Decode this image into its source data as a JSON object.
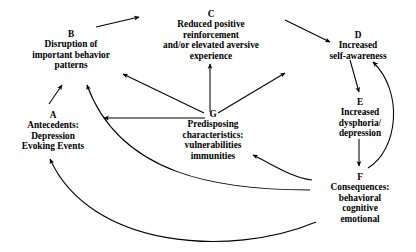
{
  "diagram": {
    "type": "flow-cycle-diagram",
    "background_color": "#ffffff",
    "line_color": "#000000",
    "nodes": [
      {
        "key": "A",
        "id_label": "A",
        "lines": [
          "Antecedents:",
          "Depression",
          "Evoking Events"
        ]
      },
      {
        "key": "B",
        "id_label": "B",
        "lines": [
          "Disruption of",
          "important behavior",
          "patterns"
        ]
      },
      {
        "key": "C",
        "id_label": "C",
        "lines": [
          "Reduced positive",
          "reinforcement",
          "and/or elevated aversive",
          "experience"
        ]
      },
      {
        "key": "D",
        "id_label": "D",
        "lines": [
          "Increased",
          "self-awareness"
        ]
      },
      {
        "key": "E",
        "id_label": "E",
        "lines": [
          "Increased",
          "dysphoria/",
          "depression"
        ]
      },
      {
        "key": "F",
        "id_label": "F",
        "lines": [
          "Consequences:",
          "behavioral",
          "cognitive",
          "emotional"
        ]
      },
      {
        "key": "G",
        "id_label": "G",
        "lines": [
          "Predisposing",
          "characteristics:",
          "vulnerabilities",
          "immunities"
        ]
      }
    ],
    "edges": [
      {
        "from": "A",
        "to": "B",
        "style": "straight"
      },
      {
        "from": "B",
        "to": "C",
        "style": "straight"
      },
      {
        "from": "C",
        "to": "D",
        "style": "straight"
      },
      {
        "from": "D",
        "to": "E",
        "style": "straight"
      },
      {
        "from": "E",
        "to": "F",
        "style": "straight"
      },
      {
        "from": "G",
        "to": "A",
        "style": "straight"
      },
      {
        "from": "G",
        "to": "B",
        "style": "straight"
      },
      {
        "from": "G",
        "to": "C",
        "style": "straight"
      },
      {
        "from": "G",
        "to": "D",
        "style": "straight"
      },
      {
        "from": "F",
        "to": "D",
        "style": "curved"
      },
      {
        "from": "F",
        "to": "G",
        "style": "curved"
      },
      {
        "from": "F",
        "to": "B",
        "style": "curved"
      },
      {
        "from": "F",
        "to": "A",
        "style": "curved"
      }
    ]
  }
}
